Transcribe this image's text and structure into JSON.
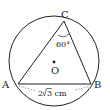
{
  "diagram": {
    "type": "geometry",
    "circle": {
      "center_label": "O",
      "cx": 54,
      "cy": 61,
      "r": 45
    },
    "points": {
      "A": {
        "label": "A",
        "x": 18,
        "y": 84
      },
      "B": {
        "label": "B",
        "x": 91,
        "y": 84
      },
      "C": {
        "label": "C",
        "x": 64,
        "y": 21
      }
    },
    "angle_label": "60°",
    "side_label": "2√3 cm",
    "labels": {
      "A": "A",
      "B": "B",
      "C": "C",
      "O": "O",
      "angle_c": "60°",
      "side_ab_prefix": "2",
      "side_ab_radical": "3",
      "side_ab_unit": " cm"
    },
    "colors": {
      "stroke": "#222222",
      "background": "#ffffff"
    }
  }
}
